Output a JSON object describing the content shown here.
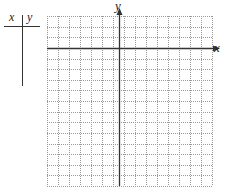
{
  "table": {
    "headers": [
      "x",
      "y"
    ],
    "rows": []
  },
  "graph": {
    "x_axis_label": "x",
    "y_axis_label": "y",
    "grid": {
      "left": 47,
      "top": 16,
      "right": 212,
      "bottom": 186,
      "columns": 15,
      "rows": 16,
      "line_color": "#9a9a9a",
      "line_style": "dotted"
    },
    "axes": {
      "origin_x": 119,
      "origin_y": 48,
      "color": "#333333"
    }
  }
}
